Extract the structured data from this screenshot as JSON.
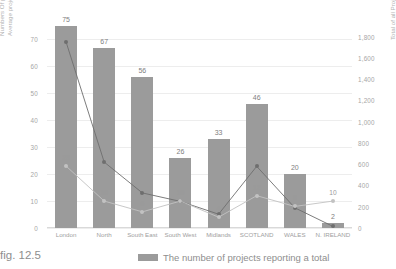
{
  "figure": {
    "caption": "fig. 12.5"
  },
  "legend": {
    "position": "bottom",
    "entries": [
      {
        "label": "The number of projects reporting a total",
        "icon": "bar-swatch",
        "color": "#9b9b9b"
      }
    ]
  },
  "chart_data": {
    "type": "bar",
    "title": "",
    "subtitle": "",
    "xlabel": "",
    "ylabel": "Numbers Of projects reporting & Average project total (£ million)",
    "y2label": "Total of all Project Values (£ million)",
    "grid": true,
    "categories": [
      "London",
      "North",
      "South East",
      "South West",
      "Midlands",
      "SCOTLAND",
      "WALES",
      "N. IRELAND"
    ],
    "ylim": [
      0,
      75
    ],
    "yticks": [
      0,
      10,
      20,
      30,
      40,
      50,
      60,
      70
    ],
    "ytick_labels": [
      "0",
      "10",
      "20",
      "30",
      "40",
      "50",
      "60",
      "70"
    ],
    "y2lim": [
      0,
      1900
    ],
    "y2ticks": [
      0,
      200,
      400,
      600,
      800,
      1000,
      1200,
      1400,
      1600,
      1800
    ],
    "y2tick_labels": [
      "0",
      "200",
      "400",
      "600",
      "800",
      "1,000",
      "1,200",
      "1,400",
      "1,600",
      "1,800"
    ],
    "series": [
      {
        "name": "The number of projects reporting a total",
        "type": "bar",
        "axis": "left",
        "color": "#9b9b9b",
        "values": [
          75,
          67,
          56,
          26,
          33,
          46,
          20,
          2
        ],
        "labels": [
          "75",
          "67",
          "56",
          "26",
          "33",
          "46",
          "20",
          "2"
        ]
      },
      {
        "name": "Total of all Project Values (£ million)",
        "type": "line",
        "axis": "right",
        "color": "#6e6e6e",
        "values": [
          1750,
          620,
          330,
          250,
          130,
          580,
          190,
          15
        ],
        "labels": [
          "",
          "",
          "",
          "",
          "",
          "",
          "",
          ""
        ]
      },
      {
        "name": "Average project total (£ million)",
        "type": "line",
        "axis": "left",
        "color": "#c2c2c2",
        "values": [
          23,
          10,
          6,
          10,
          4,
          12,
          8,
          10
        ],
        "labels": [
          "23",
          "10",
          "6",
          "10",
          "4",
          "12",
          "8",
          "10"
        ]
      }
    ]
  }
}
